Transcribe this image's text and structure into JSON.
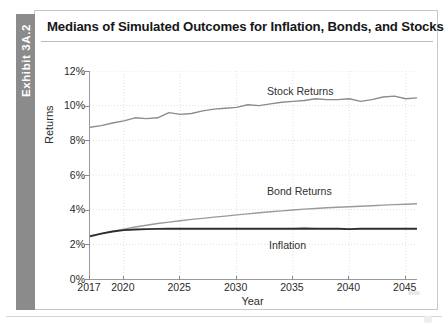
{
  "exhibit": {
    "tab_label": "Exhibit 3A.2",
    "tab_color": "#8b8b8b",
    "title": "Medians of Simulated Outcomes for Inflation, Bonds, and Stocks"
  },
  "chart_data": {
    "type": "line",
    "title": "Medians of Simulated Outcomes for Inflation, Bonds, and Stocks",
    "xlabel": "Year",
    "ylabel": "Returns",
    "xlim": [
      2017,
      2046
    ],
    "ylim": [
      0,
      12
    ],
    "grid": true,
    "grid_style": "dotted",
    "grid_color": "#d9d9d9",
    "legend_position": "inline-annotations",
    "y_tick_labels": [
      "0%",
      "2%",
      "4%",
      "6%",
      "8%",
      "10%",
      "12%"
    ],
    "y_ticks": [
      0,
      2,
      4,
      6,
      8,
      10,
      12
    ],
    "x_tick_labels": [
      "2017",
      "2020",
      "2025",
      "2030",
      "2035",
      "2040",
      "2045"
    ],
    "x_ticks": [
      2017,
      2020,
      2025,
      2030,
      2035,
      2040,
      2045
    ],
    "x": [
      2017,
      2018,
      2019,
      2020,
      2021,
      2022,
      2023,
      2024,
      2025,
      2026,
      2027,
      2028,
      2029,
      2030,
      2031,
      2032,
      2033,
      2034,
      2035,
      2036,
      2037,
      2038,
      2039,
      2040,
      2041,
      2042,
      2043,
      2044,
      2045,
      2046
    ],
    "series": [
      {
        "name": "Stock Returns",
        "annotation": "Stock Returns",
        "color": "#8c8c8c",
        "width": 1.4,
        "values": [
          8.75,
          8.85,
          9.0,
          9.12,
          9.3,
          9.25,
          9.3,
          9.6,
          9.5,
          9.55,
          9.7,
          9.8,
          9.85,
          9.9,
          10.05,
          10.0,
          10.1,
          10.2,
          10.25,
          10.3,
          10.4,
          10.35,
          10.35,
          10.4,
          10.25,
          10.35,
          10.5,
          10.55,
          10.4,
          10.45
        ]
      },
      {
        "name": "Bond Returns",
        "annotation": "Bond Returns",
        "color": "#9a9a9a",
        "width": 1.4,
        "values": [
          2.5,
          2.62,
          2.75,
          2.88,
          3.0,
          3.1,
          3.2,
          3.28,
          3.36,
          3.44,
          3.5,
          3.57,
          3.63,
          3.7,
          3.76,
          3.82,
          3.88,
          3.93,
          3.98,
          4.03,
          4.07,
          4.11,
          4.14,
          4.17,
          4.2,
          4.23,
          4.26,
          4.29,
          4.31,
          4.34
        ]
      },
      {
        "name": "Inflation",
        "annotation": "Inflation",
        "color": "#2e2e2e",
        "width": 1.9,
        "values": [
          2.46,
          2.62,
          2.74,
          2.82,
          2.86,
          2.88,
          2.89,
          2.9,
          2.9,
          2.9,
          2.9,
          2.9,
          2.9,
          2.9,
          2.9,
          2.9,
          2.9,
          2.9,
          2.9,
          2.91,
          2.9,
          2.9,
          2.9,
          2.88,
          2.9,
          2.9,
          2.9,
          2.9,
          2.9,
          2.9
        ]
      }
    ]
  }
}
